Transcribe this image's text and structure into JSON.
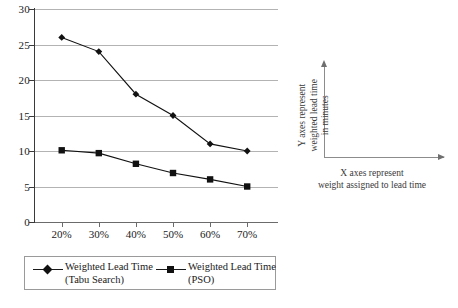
{
  "chart_data": {
    "type": "line",
    "title": "",
    "xlabel": "X axes represent weight assigned to lead time",
    "ylabel": "Y axes represent weighted lead time in minutes",
    "categories": [
      "20%",
      "30%",
      "40%",
      "50%",
      "60%",
      "70%"
    ],
    "yticks": [
      0,
      5,
      10,
      15,
      20,
      25,
      30
    ],
    "ylim": [
      0,
      30
    ],
    "grid": true,
    "legend_position": "bottom",
    "series": [
      {
        "name": "Weighted Lead Time (Tabu Search)",
        "marker": "diamond",
        "color": "#111111",
        "values": [
          26,
          24,
          18,
          15,
          11,
          10
        ]
      },
      {
        "name": "Weighted Lead Time (PSO)",
        "marker": "square",
        "color": "#111111",
        "values": [
          10.1,
          9.7,
          8.2,
          6.9,
          6,
          5
        ]
      }
    ]
  },
  "legend": {
    "items": [
      {
        "line1": "Weighted Lead Time",
        "line2": "(Tabu Search)",
        "marker": "diamond-marker-icon"
      },
      {
        "line1": "Weighted Lead Time",
        "line2": "(PSO)",
        "marker": "square-marker-icon"
      }
    ]
  },
  "side_note": {
    "y_line1": "Y axes represent",
    "y_line2": "weighted lead time",
    "y_line3": "in minutes",
    "x_line1": "X axes represent",
    "x_line2": "weight assigned to lead time"
  }
}
